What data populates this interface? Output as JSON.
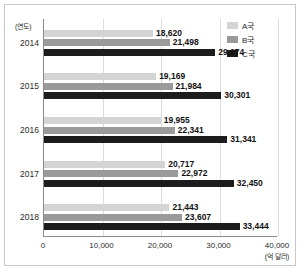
{
  "chart_data": {
    "type": "bar",
    "orientation": "horizontal",
    "title": "",
    "xlabel": "(억 달러)",
    "ylabel": "(연도)",
    "xlim": [
      0,
      40000
    ],
    "xticks": [
      "0",
      "10,000",
      "20,000",
      "30,000",
      "40,000"
    ],
    "xtick_values": [
      0,
      10000,
      20000,
      30000,
      40000
    ],
    "grid": true,
    "legend_position": "top-right",
    "categories": [
      "2014",
      "2015",
      "2016",
      "2017",
      "2018"
    ],
    "series": [
      {
        "name": "A국",
        "color": "#d4d4d4",
        "values": [
          18620,
          19169,
          19955,
          20717,
          21443
        ],
        "labels": [
          "18,620",
          "19,169",
          "19,955",
          "20,717",
          "21,443"
        ]
      },
      {
        "name": "B국",
        "color": "#9a9a9a",
        "values": [
          21498,
          21984,
          22341,
          22972,
          23607
        ],
        "labels": [
          "21,498",
          "21,984",
          "22,341",
          "22,972",
          "23,607"
        ]
      },
      {
        "name": "C국",
        "color": "#1c1c1c",
        "values": [
          29274,
          30301,
          31341,
          32450,
          33444
        ],
        "labels": [
          "29,274",
          "30,301",
          "31,341",
          "32,450",
          "33,444"
        ]
      }
    ]
  }
}
